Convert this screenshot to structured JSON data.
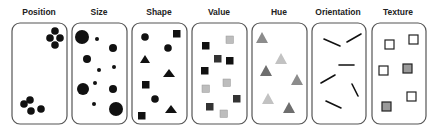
{
  "panels": [
    {
      "id": "position",
      "label": "Position",
      "x": 11,
      "w": 56
    },
    {
      "id": "size",
      "label": "Size",
      "x": 72,
      "w": 55
    },
    {
      "id": "shape",
      "label": "Shape",
      "x": 131,
      "w": 57
    },
    {
      "id": "value",
      "label": "Value",
      "x": 191,
      "w": 57
    },
    {
      "id": "hue",
      "label": "Hue",
      "x": 251,
      "w": 56
    },
    {
      "id": "orientation",
      "label": "Orientation",
      "x": 311,
      "w": 55
    },
    {
      "id": "texture",
      "label": "Texture",
      "x": 371,
      "w": 55
    }
  ],
  "colors": {
    "black": "#111111",
    "dark_gray": "#3a3a3a",
    "light_gray": "#bdbdbd",
    "hue_dark": "#6e6e6e",
    "hue_mid": "#8c8c8c",
    "hue_light": "#c2c2c2",
    "texture_fill": "#9a9a9a"
  }
}
